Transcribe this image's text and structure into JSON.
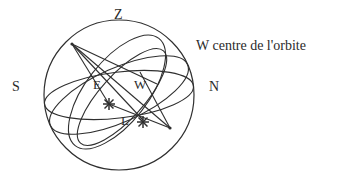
{
  "figure": {
    "title_caption": "W centre de l'orbite",
    "background_color": "#ffffff",
    "line_color": "#2f2f2f",
    "text_color": "#2b2b2b",
    "labels": {
      "zenith": "Z",
      "south": "S",
      "north": "N",
      "east_point": "E",
      "west_point": "W",
      "orbit_point": "L"
    },
    "markers": {
      "star_one": "star-marker",
      "star_two": "star-marker"
    },
    "icons": {
      "sphere": "sphere-outline-icon",
      "horizon": "horizon-ellipse-icon",
      "equator": "equator-ellipse-icon",
      "orbit": "orbit-ellipse-icon",
      "meridian": "meridian-ellipse-icon",
      "chord": "chord-line-icon"
    }
  }
}
